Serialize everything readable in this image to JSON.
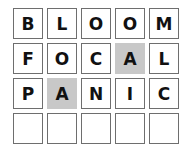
{
  "board": {
    "rows": [
      {
        "tiles": [
          {
            "letter": "B",
            "state": "absent"
          },
          {
            "letter": "L",
            "state": "absent"
          },
          {
            "letter": "O",
            "state": "absent"
          },
          {
            "letter": "O",
            "state": "absent"
          },
          {
            "letter": "M",
            "state": "absent"
          }
        ]
      },
      {
        "tiles": [
          {
            "letter": "F",
            "state": "absent"
          },
          {
            "letter": "O",
            "state": "absent"
          },
          {
            "letter": "C",
            "state": "absent"
          },
          {
            "letter": "A",
            "state": "present"
          },
          {
            "letter": "L",
            "state": "absent"
          }
        ]
      },
      {
        "tiles": [
          {
            "letter": "P",
            "state": "absent"
          },
          {
            "letter": "A",
            "state": "present"
          },
          {
            "letter": "N",
            "state": "absent"
          },
          {
            "letter": "I",
            "state": "absent"
          },
          {
            "letter": "C",
            "state": "absent"
          }
        ]
      },
      {
        "tiles": [
          {
            "letter": "",
            "state": "empty"
          },
          {
            "letter": "",
            "state": "empty"
          },
          {
            "letter": "",
            "state": "empty"
          },
          {
            "letter": "",
            "state": "empty"
          },
          {
            "letter": "",
            "state": "empty"
          }
        ]
      }
    ]
  },
  "colors": {
    "present": "#c8c8c8",
    "border": "#6e6e6e"
  }
}
